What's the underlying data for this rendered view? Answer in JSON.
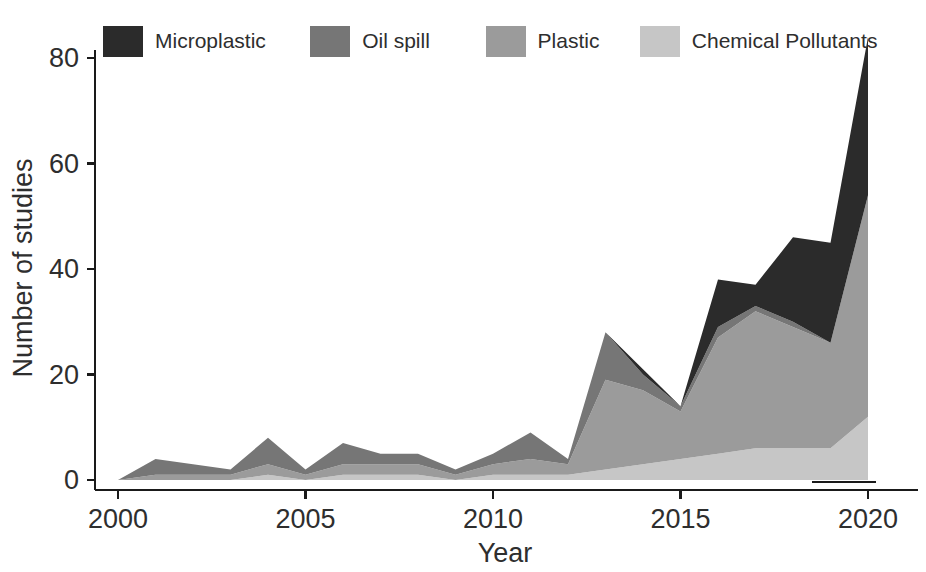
{
  "chart_data": {
    "type": "area",
    "stacked": true,
    "title": "",
    "xlabel": "Year",
    "ylabel": "Number of studies",
    "x": [
      2000,
      2001,
      2002,
      2003,
      2004,
      2005,
      2006,
      2007,
      2008,
      2009,
      2010,
      2011,
      2012,
      2013,
      2014,
      2015,
      2016,
      2017,
      2018,
      2019,
      2020
    ],
    "xtick_labels": [
      "2000",
      "2005",
      "2010",
      "2015",
      "2020"
    ],
    "xticks": [
      2000,
      2005,
      2010,
      2015,
      2020
    ],
    "xlim": [
      2000,
      2020
    ],
    "ytick_labels": [
      "0",
      "20",
      "40",
      "60",
      "80"
    ],
    "yticks": [
      0,
      20,
      40,
      60,
      80
    ],
    "ylim": [
      0,
      86
    ],
    "grid": false,
    "legend_position": "top-left",
    "series": [
      {
        "name": "Chemical Pollutants",
        "color": "#c6c6c6",
        "values": [
          0,
          0,
          0,
          0,
          1,
          0,
          1,
          1,
          1,
          0,
          1,
          1,
          1,
          2,
          3,
          4,
          5,
          6,
          6,
          6,
          12
        ]
      },
      {
        "name": "Plastic",
        "color": "#9b9b9b",
        "values": [
          0,
          1,
          1,
          1,
          2,
          1,
          2,
          2,
          2,
          1,
          2,
          3,
          2,
          17,
          14,
          9,
          22,
          26,
          23,
          20,
          42
        ]
      },
      {
        "name": "Oil spill",
        "color": "#767676",
        "values": [
          0,
          3,
          2,
          1,
          5,
          1,
          4,
          2,
          2,
          1,
          2,
          5,
          1,
          9,
          3,
          1,
          2,
          1,
          1,
          0,
          0
        ]
      },
      {
        "name": "Microplastic",
        "color": "#2b2b2b",
        "values": [
          0,
          0,
          0,
          0,
          0,
          0,
          0,
          0,
          0,
          0,
          0,
          0,
          0,
          0,
          1,
          0,
          9,
          4,
          16,
          19,
          30
        ]
      }
    ],
    "series_order_bottom_to_top": [
      "Chemical Pollutants",
      "Plastic",
      "Oil spill",
      "Microplastic"
    ],
    "totals": [
      0,
      4,
      3,
      2,
      8,
      2,
      7,
      5,
      5,
      2,
      5,
      9,
      4,
      28,
      21,
      14,
      38,
      37,
      46,
      45,
      84
    ],
    "annotations": [
      {
        "name": "axis-underline-artifact",
        "x_start": 2018.5,
        "x_end": 2020.2,
        "y_px_below_axis": 8
      }
    ]
  },
  "legend": {
    "items": [
      {
        "label": "Microplastic",
        "color": "#2b2b2b"
      },
      {
        "label": "Oil spill",
        "color": "#767676"
      },
      {
        "label": "Plastic",
        "color": "#9b9b9b"
      },
      {
        "label": "Chemical Pollutants",
        "color": "#c6c6c6"
      }
    ]
  },
  "colors": {
    "background": "#ffffff",
    "axis": "#1a1a1a",
    "text": "#2e2e2e"
  }
}
